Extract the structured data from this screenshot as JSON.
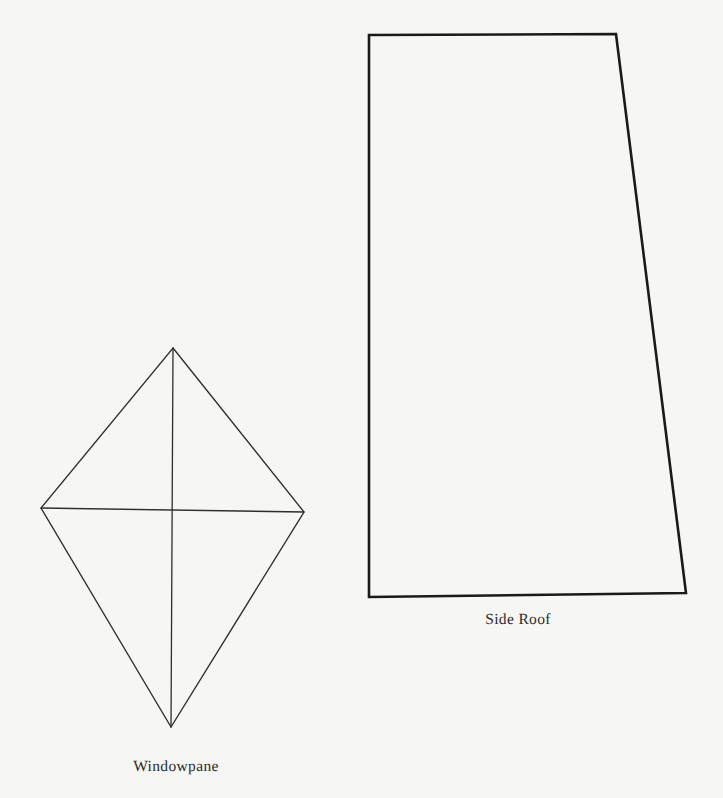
{
  "page": {
    "background_color": "#f6f6f5",
    "width": 723,
    "height": 798
  },
  "style": {
    "kite_stroke_color": "#2e2e2e",
    "kite_stroke_width": 1.35,
    "roof_stroke_color": "#1a1a1a",
    "roof_stroke_width": 2.6,
    "label_color": "#2b2b2b"
  },
  "shapes": [
    {
      "id": "windowpane",
      "label": "Windowpane",
      "type": "kite",
      "label_position": {
        "x": 176,
        "y": 772
      },
      "outline_points": "173,348 304,512 171,727 41,508",
      "vertices": {
        "top": {
          "x": 173,
          "y": 348
        },
        "right": {
          "x": 304,
          "y": 512
        },
        "bottom": {
          "x": 171,
          "y": 727
        },
        "left": {
          "x": 41,
          "y": 508
        }
      },
      "interior_lines": [
        {
          "name": "vertical-axis",
          "x1": 173,
          "y1": 348,
          "x2": 171,
          "y2": 727
        },
        {
          "name": "horizontal-axis",
          "x1": 41,
          "y1": 508,
          "x2": 304,
          "y2": 512
        }
      ]
    },
    {
      "id": "side-roof",
      "label": "Side Roof",
      "type": "trapezoid",
      "label_position": {
        "x": 518,
        "y": 625
      },
      "outline_points": "369,35 616,34 686,593 369,597",
      "vertices": {
        "top_left": {
          "x": 369,
          "y": 35
        },
        "top_right": {
          "x": 616,
          "y": 34
        },
        "bottom_right": {
          "x": 686,
          "y": 593
        },
        "bottom_left": {
          "x": 369,
          "y": 597
        }
      },
      "interior_lines": []
    }
  ]
}
